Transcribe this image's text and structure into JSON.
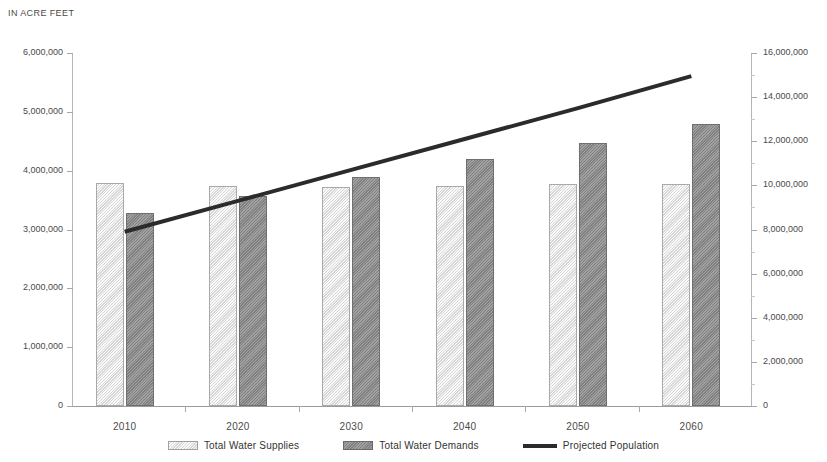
{
  "caption": "IN ACRE FEET",
  "legend": [
    {
      "key": "supplies",
      "label": "Total Water Supplies",
      "swatch": "bar-swatch-light"
    },
    {
      "key": "demands",
      "label": "Total Water Demands",
      "swatch": "bar-swatch-dark"
    },
    {
      "key": "population",
      "label": "Projected Population",
      "swatch": "line-swatch-black"
    }
  ],
  "colors": {
    "supplies_bar": "#dedede",
    "supplies_border": "#a9a9a9",
    "demands_bar": "#8f8f8f",
    "demands_border": "#6f6f6f",
    "population_line": "#2b2b2b",
    "axis": "#a8a8a8",
    "text": "#4a4a4a"
  },
  "axes": {
    "left": {
      "title": "IN ACRE FEET",
      "min": 0,
      "max": 6000000,
      "step": 1000000,
      "ticks": [
        "0",
        "1,000,000",
        "2,000,000",
        "3,000,000",
        "4,000,000",
        "5,000,000",
        "6,000,000"
      ]
    },
    "right": {
      "min": 0,
      "max": 16000000,
      "step": 2000000,
      "ticks": [
        "0",
        "2,000,000",
        "4,000,000",
        "6,000,000",
        "8,000,000",
        "10,000,000",
        "12,000,000",
        "14,000,000",
        "16,000,000"
      ]
    },
    "x": {
      "categories": [
        "2010",
        "2020",
        "2030",
        "2040",
        "2050",
        "2060"
      ]
    }
  },
  "chart_data": {
    "type": "bar",
    "title": "",
    "subtitle": "",
    "xlabel": "",
    "ylabel": "IN ACRE FEET",
    "y2label": "",
    "categories": [
      "2010",
      "2020",
      "2030",
      "2040",
      "2050",
      "2060"
    ],
    "ylim": [
      0,
      6000000
    ],
    "y2lim": [
      0,
      16000000
    ],
    "grid": false,
    "legend_position": "bottom",
    "series": [
      {
        "name": "Total Water Supplies",
        "type": "bar",
        "axis": "left",
        "color": "#dedede",
        "values": [
          3790000,
          3740000,
          3720000,
          3740000,
          3780000,
          3780000
        ]
      },
      {
        "name": "Total Water Demands",
        "type": "bar",
        "axis": "left",
        "color": "#8f8f8f",
        "values": [
          3280000,
          3570000,
          3890000,
          4200000,
          4470000,
          4790000
        ]
      },
      {
        "name": "Projected Population",
        "type": "line",
        "axis": "right",
        "color": "#2b2b2b",
        "values": [
          7900000,
          9300000,
          10700000,
          12100000,
          13500000,
          14950000
        ]
      }
    ]
  }
}
